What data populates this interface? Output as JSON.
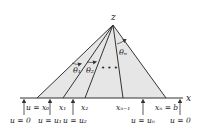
{
  "diagram": {
    "apex_label": "z",
    "axis_label": "x",
    "angles": {
      "theta1": "θ₁",
      "theta2": "θ₂",
      "thetan": "θₙ",
      "ellipsis": "• • •"
    },
    "base_points": [
      {
        "label": "u = x₀"
      },
      {
        "label": "x₁"
      },
      {
        "label": "x₂"
      },
      {
        "label": "xₙ₋₁"
      },
      {
        "label": "xₙ = b"
      }
    ],
    "boundary_conditions": [
      {
        "label": "u = 0"
      },
      {
        "label": "u = u₁"
      },
      {
        "label": "u = u₂"
      },
      {
        "label": "u = uₙ"
      },
      {
        "label": "u = 0"
      }
    ],
    "colors": {
      "fill": "#e6e6e6",
      "stroke": "#333333",
      "text": "#222222"
    }
  }
}
